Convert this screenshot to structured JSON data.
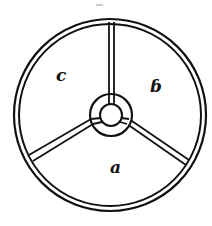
{
  "diagram": {
    "type": "wheel-sector-diagram",
    "stroke_color": "#111111",
    "background": "#ffffff",
    "center": [
      110,
      115
    ],
    "rim": {
      "outer_radius": 96,
      "inner_radius": 91
    },
    "hub": {
      "outer_radius": 21,
      "inner_radius": 11
    },
    "spokes": [
      {
        "name": "top",
        "angle_deg": -90
      },
      {
        "name": "lower-left",
        "angle_deg": 152
      },
      {
        "name": "lower-right",
        "angle_deg": 28
      }
    ],
    "sectors": [
      {
        "id": "a",
        "label": "a",
        "position": "bottom"
      },
      {
        "id": "b",
        "label": "ɓ",
        "position": "upper-right"
      },
      {
        "id": "c",
        "label": "c",
        "position": "upper-left"
      }
    ]
  }
}
